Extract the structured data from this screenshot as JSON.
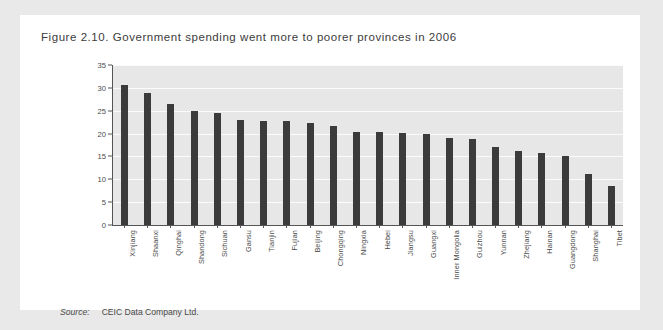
{
  "figure": {
    "title": "Figure 2.10. Government spending went more to poorer provinces in 2006",
    "source_label": "Source:",
    "source_text": "CEIC Data Company Ltd."
  },
  "colors": {
    "bar": "#3b3b3b",
    "plot_background": "#e7e7e7",
    "gridline": "#fbfbfb",
    "axis": "#555555",
    "card_background": "#ffffff",
    "page_background": "#e9e9e9"
  },
  "chart_data": {
    "type": "bar",
    "title": "Figure 2.10. Government spending went more to poorer provinces in 2006",
    "xlabel": "",
    "ylabel": "Government spending growth (per cent)",
    "ylim": [
      0,
      35
    ],
    "yticks": [
      0,
      5,
      10,
      15,
      20,
      25,
      30,
      35
    ],
    "grid": true,
    "legend": "none",
    "categories": [
      "Xinjiang",
      "Shaanxi",
      "Qinghai",
      "Shandong",
      "Sichuan",
      "Gansu",
      "Tianjin",
      "Fujian",
      "Beijing",
      "Chongqing",
      "Ningxia",
      "Hebei",
      "Jiangsu",
      "Guangxi",
      "Inner Mongolia",
      "Guizhou",
      "Yunnan",
      "Zhejiang",
      "Hainan",
      "Guangdong",
      "Shanghai",
      "Tibet"
    ],
    "values": [
      30.7,
      28.9,
      26.4,
      25.0,
      24.5,
      23.0,
      22.8,
      22.7,
      22.4,
      21.7,
      20.4,
      20.3,
      20.1,
      19.9,
      19.0,
      18.9,
      17.0,
      16.3,
      15.8,
      15.1,
      11.1,
      8.5
    ]
  }
}
